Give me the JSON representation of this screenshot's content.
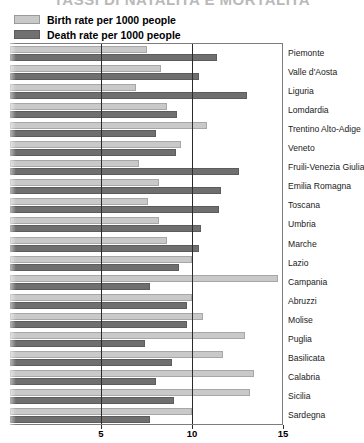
{
  "title": "TASSI DI NATALITA E MORTALITA",
  "legend": {
    "items": [
      {
        "label": "Birth rate per 1000 people",
        "color": "#c9c9c9",
        "key": "birth"
      },
      {
        "label": "Death rate per 1000 people",
        "color": "#6f6f6f",
        "key": "death"
      }
    ]
  },
  "axis": {
    "ticks": [
      "5",
      "10",
      "15"
    ],
    "tick_values": [
      5,
      10,
      15
    ],
    "xmin": 0,
    "xmax": 15
  },
  "chart_data": {
    "type": "bar",
    "orientation": "horizontal",
    "title": "TASSI DI NATALITA E MORTALITA",
    "xlabel": "",
    "ylabel": "",
    "xlim": [
      0,
      15
    ],
    "grid": true,
    "legend_position": "top-left",
    "categories": [
      "Piemonte",
      "Valle d'Aosta",
      "Liguria",
      "Lomdardia",
      "Trentino Alto-Adige",
      "Veneto",
      "Fruili-Venezia Giulia",
      "Emilia Romagna",
      "Toscana",
      "Umbria",
      "Marche",
      "Lazio",
      "Campania",
      "Abruzzi",
      "Molise",
      "Puglia",
      "Basilicata",
      "Calabria",
      "Sicilia",
      "Sardegna"
    ],
    "series": [
      {
        "name": "Birth rate per 1000 people",
        "color": "#c9c9c9",
        "values": [
          7.5,
          8.3,
          6.9,
          8.6,
          10.8,
          9.4,
          7.1,
          8.2,
          7.6,
          8.2,
          8.6,
          10.0,
          14.7,
          10.0,
          10.6,
          12.9,
          11.7,
          13.4,
          13.2,
          10.0
        ]
      },
      {
        "name": "Death rate per 1000 people",
        "color": "#6f6f6f",
        "values": [
          11.4,
          10.4,
          13.0,
          9.2,
          8.0,
          9.1,
          12.6,
          11.6,
          11.5,
          10.5,
          10.4,
          9.3,
          7.7,
          9.7,
          9.7,
          7.4,
          8.9,
          8.0,
          9.0,
          7.7
        ]
      }
    ]
  }
}
